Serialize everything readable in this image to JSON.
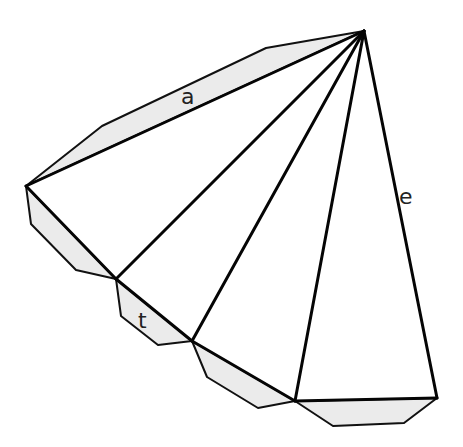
{
  "diagram": {
    "type": "pyramid-net",
    "labels": {
      "a": "a",
      "e": "e",
      "t": "t"
    },
    "colors": {
      "flap_fill": "#ebebeb",
      "edge": "#050505",
      "background": "#ffffff"
    },
    "apex": [
      364,
      31
    ],
    "base_vertices": [
      [
        26,
        186
      ],
      [
        116,
        279
      ],
      [
        192,
        341
      ],
      [
        295,
        401
      ],
      [
        437,
        398
      ]
    ],
    "faces": 4,
    "flaps": 5
  }
}
